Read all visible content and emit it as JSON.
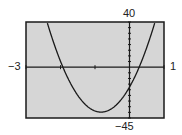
{
  "chart_data": {
    "type": "line",
    "title": "",
    "xlabel": "",
    "ylabel": "",
    "xlim": [
      -3,
      1
    ],
    "ylim": [
      -45,
      40
    ],
    "xscl": 1,
    "yscl": 5,
    "grid": false,
    "legend": null,
    "window_labels": {
      "xmin": "−3",
      "xmax": "1",
      "ymin": "−45",
      "ymax": "40"
    },
    "series": [
      {
        "name": "parabola",
        "equation_estimate": "y = 32.6(x + 1.93)(x − 0.28)",
        "coefficients": {
          "a": 32.6,
          "root1": -1.93,
          "root2": 0.28
        },
        "key_points": {
          "x_intercepts": [
            -1.93,
            0.28
          ],
          "y_intercept": -17.6,
          "vertex": [
            -0.83,
            -39.8
          ]
        }
      }
    ]
  },
  "screen": {
    "frame_px": {
      "left": 26,
      "top": 22,
      "right": 164,
      "bottom": 118
    },
    "colors": {
      "screen_bg": "#d6d6d6",
      "ink": "#1a1a1a",
      "page_bg": "#ffffff"
    }
  }
}
